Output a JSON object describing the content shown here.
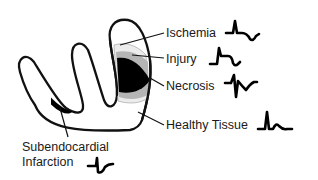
{
  "diagram": {
    "type": "myocardial-infarction-ecg-zones",
    "colors": {
      "outline": "#111111",
      "necrosis": "#000000",
      "injury": "#b5b5b5",
      "ischemia": "#ececec",
      "background": "#ffffff"
    },
    "labels": {
      "ischemia": "Ischemia",
      "injury": "Injury",
      "necrosis": "Necrosis",
      "healthy": "Healthy Tissue",
      "subendo_line1": "Subendocardial",
      "subendo_line2": "Infarction"
    },
    "waveforms": [
      {
        "zone": "ischemia",
        "shape": "inverted T wave",
        "icon": "ecg-ischemia-icon"
      },
      {
        "zone": "injury",
        "shape": "ST elevation",
        "icon": "ecg-injury-icon"
      },
      {
        "zone": "necrosis",
        "shape": "Q wave with inverted T",
        "icon": "ecg-necrosis-icon"
      },
      {
        "zone": "healthy",
        "shape": "normal QRS-T",
        "icon": "ecg-normal-icon"
      },
      {
        "zone": "subendocardial",
        "shape": "ST depression",
        "icon": "ecg-subendocardial-icon"
      }
    ]
  }
}
